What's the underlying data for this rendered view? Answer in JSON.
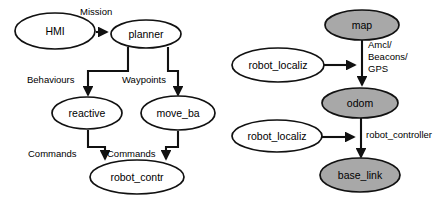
{
  "figure": {
    "background_color": "#ffffff",
    "node_fill_white": "#ffffff",
    "node_fill_gray": "#a8a8a8",
    "stroke_color": "#111111"
  },
  "left_diagram": {
    "name": "software-architecture-diagram",
    "nodes": [
      {
        "id": "hmi",
        "label": "HMI",
        "cx": 55,
        "cy": 31,
        "rx": 40,
        "ry": 18,
        "fill": "white"
      },
      {
        "id": "planner",
        "label": "planner",
        "cx": 146,
        "cy": 34,
        "rx": 35,
        "ry": 14,
        "fill": "white"
      },
      {
        "id": "reactive",
        "label": "reactive",
        "cx": 87,
        "cy": 113,
        "rx": 35,
        "ry": 16,
        "fill": "white"
      },
      {
        "id": "move_ba",
        "label": "move_ba",
        "cx": 178,
        "cy": 113,
        "rx": 37,
        "ry": 17,
        "fill": "white"
      },
      {
        "id": "robot_contr",
        "label": "robot_contr",
        "cx": 137,
        "cy": 177,
        "rx": 47,
        "ry": 17,
        "fill": "white"
      }
    ],
    "edges": [
      {
        "id": "hmi-to-planner",
        "label": "Mission",
        "label_x": 80,
        "label_y": 12
      },
      {
        "id": "planner-to-reactive",
        "label": "Behaviours",
        "label_x": 27,
        "label_y": 80
      },
      {
        "id": "planner-to-move_ba",
        "label": "Waypoints",
        "label_x": 122,
        "label_y": 80
      },
      {
        "id": "reactive-to-robot_contr",
        "label": "Commands",
        "label_x": 28,
        "label_y": 154
      },
      {
        "id": "move_ba-to-robot_contr",
        "label": "Commands",
        "label_x": 107,
        "label_y": 154
      }
    ]
  },
  "right_diagram": {
    "name": "tf-frame-tree-diagram",
    "nodes": [
      {
        "id": "map",
        "label": "map",
        "cx": 362,
        "cy": 25,
        "rx": 37,
        "ry": 15,
        "fill": "gray"
      },
      {
        "id": "robot_localiz_top",
        "label": "robot_localiz",
        "cx": 278,
        "cy": 65,
        "rx": 46,
        "ry": 17,
        "fill": "white"
      },
      {
        "id": "odom",
        "label": "odom",
        "cx": 360,
        "cy": 103,
        "rx": 38,
        "ry": 15,
        "fill": "gray"
      },
      {
        "id": "robot_localiz_bottom",
        "label": "robot_localiz",
        "cx": 277,
        "cy": 136,
        "rx": 45,
        "ry": 16,
        "fill": "white"
      },
      {
        "id": "base_link",
        "label": "base_link",
        "cx": 360,
        "cy": 175,
        "rx": 40,
        "ry": 17,
        "fill": "gray"
      }
    ],
    "edges": [
      {
        "id": "map-to-odom",
        "label_lines": [
          "Amcl/",
          "Beacons/",
          "GPS"
        ],
        "label_x": 368,
        "label_y": 45
      },
      {
        "id": "robot_localiz_top-to-link",
        "label": ""
      },
      {
        "id": "odom-to-base_link",
        "label": "robot_controller",
        "label_x": 366,
        "label_y": 135
      },
      {
        "id": "robot_localiz_bottom-to-link",
        "label": ""
      }
    ]
  }
}
